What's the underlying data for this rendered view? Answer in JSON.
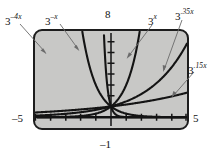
{
  "figure": {
    "kind": "graphing-calculator-screen",
    "background_color": "#ffffff",
    "screen_color": "#c8c8c6",
    "ink_color": "#141414",
    "leader_color": "#6b6b6b"
  },
  "window_labels": {
    "ymax": "8",
    "ymin": "–1",
    "xmin": "–5",
    "xmax": "5"
  },
  "curve_labels": [
    {
      "id": "c-neg4x",
      "base": "3",
      "exponent": "–4x",
      "text": "3⁻⁴ˣ"
    },
    {
      "id": "c-negx",
      "base": "3",
      "exponent": "–x",
      "text": "3⁻ˣ"
    },
    {
      "id": "c-x",
      "base": "3",
      "exponent": "x",
      "text": "3ˣ"
    },
    {
      "id": "c-p35x",
      "base": "3",
      "exponent": ".35x",
      "text": "3·³⁵ˣ"
    },
    {
      "id": "c-p15x",
      "base": "3",
      "exponent": ".15x",
      "text": "3·¹⁵ˣ"
    }
  ],
  "chart_data": {
    "type": "line",
    "title": "",
    "xlabel": "",
    "ylabel": "",
    "xlim": [
      -5,
      5
    ],
    "ylim": [
      -1,
      8
    ],
    "xtick_step": 1,
    "ytick_step": 1,
    "grid": false,
    "legend": "annotated-labels-with-leader-lines",
    "axis_tick_labels": {
      "xmin": "–5",
      "xmax": "5",
      "ymin": "–1",
      "ymax": "8"
    },
    "x": [
      -5,
      -4.5,
      -4,
      -3.5,
      -3,
      -2.5,
      -2,
      -1.5,
      -1,
      -0.5,
      0,
      0.5,
      1,
      1.5,
      2,
      2.5,
      3,
      3.5,
      4,
      4.5,
      5
    ],
    "series": [
      {
        "name": "3^-4x",
        "label": "3⁻⁴ˣ",
        "base": 3,
        "coefficient": -4,
        "values": [
          null,
          null,
          null,
          null,
          null,
          null,
          null,
          null,
          null,
          7.39,
          1,
          0.135,
          0.0123,
          0.0017,
          0.0002,
          0,
          0,
          0,
          0,
          0,
          0
        ]
      },
      {
        "name": "3^-x",
        "label": "3⁻ˣ",
        "base": 3,
        "coefficient": -1,
        "values": [
          null,
          null,
          null,
          null,
          null,
          15.59,
          9,
          5.196,
          3,
          1.732,
          1,
          0.577,
          0.333,
          0.192,
          0.111,
          0.064,
          0.037,
          0.021,
          0.012,
          0.007,
          0.004
        ]
      },
      {
        "name": "3^x",
        "label": "3ˣ",
        "base": 3,
        "coefficient": 1,
        "values": [
          0.004,
          0.007,
          0.012,
          0.021,
          0.037,
          0.064,
          0.111,
          0.192,
          0.333,
          0.577,
          1,
          1.732,
          3,
          5.196,
          9,
          15.59,
          null,
          null,
          null,
          null,
          null
        ]
      },
      {
        "name": "3^.35x",
        "label": "3·³⁵ˣ",
        "base": 3,
        "coefficient": 0.35,
        "values": [
          0.26,
          0.3,
          0.34,
          0.38,
          0.44,
          0.5,
          0.57,
          0.65,
          0.73,
          0.83,
          1,
          1.14,
          1.3,
          1.49,
          1.69,
          1.93,
          2.2,
          2.51,
          2.86,
          3.26,
          3.71
        ]
      },
      {
        "name": "3^.15x",
        "label": "3·¹⁵ˣ",
        "base": 3,
        "coefficient": 0.15,
        "values": [
          0.56,
          0.6,
          0.64,
          0.68,
          0.73,
          0.77,
          0.82,
          0.88,
          0.93,
          0.99,
          1,
          1.07,
          1.13,
          1.21,
          1.28,
          1.36,
          1.45,
          1.54,
          1.64,
          1.74,
          1.85
        ]
      }
    ],
    "common_point": {
      "x": 0,
      "y": 1,
      "note": "all curves pass through (0, 1)"
    }
  }
}
